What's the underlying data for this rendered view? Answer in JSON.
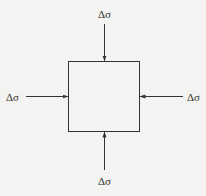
{
  "diagram": {
    "title": "",
    "element": {
      "shape": "square",
      "label": ""
    },
    "stress_label": "Δσ",
    "arrows": [
      {
        "side": "top",
        "label": "Δσ",
        "direction": "inward"
      },
      {
        "side": "bottom",
        "label": "Δσ",
        "direction": "inward"
      },
      {
        "side": "left",
        "label": "Δσ",
        "direction": "inward"
      },
      {
        "side": "right",
        "label": "Δσ",
        "direction": "inward"
      }
    ],
    "colors": {
      "line": "#333333",
      "background": "#f3f3f1"
    }
  }
}
